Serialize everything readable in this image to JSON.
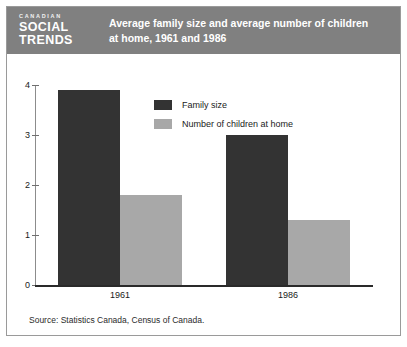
{
  "header": {
    "brand_line1": "CANADIAN",
    "brand_line2": "SOCIAL",
    "brand_line3": "TRENDS",
    "title_line1": "Average family size and average number of children",
    "title_line2": "at home, 1961 and 1986",
    "background_color": "#808080",
    "text_color": "#ffffff"
  },
  "source": {
    "text": "Source: Statistics Canada, Census of Canada."
  },
  "chart_data": {
    "type": "bar",
    "title": "Average family size and average number of children at home, 1961 and 1986",
    "xlabel": "",
    "ylabel": "",
    "categories": [
      "1961",
      "1986"
    ],
    "series": [
      {
        "name": "Family size",
        "color": "#333333",
        "values": [
          3.9,
          3.0
        ]
      },
      {
        "name": "Number of children at home",
        "color": "#a8a8a8",
        "values": [
          1.8,
          1.3
        ]
      }
    ],
    "ylim": [
      0,
      4
    ],
    "yticks": [
      0,
      1,
      2,
      3,
      4
    ],
    "ytick_labels": [
      "0",
      "1",
      "2",
      "3",
      "4"
    ],
    "grid": false,
    "legend_position": "upper center"
  }
}
